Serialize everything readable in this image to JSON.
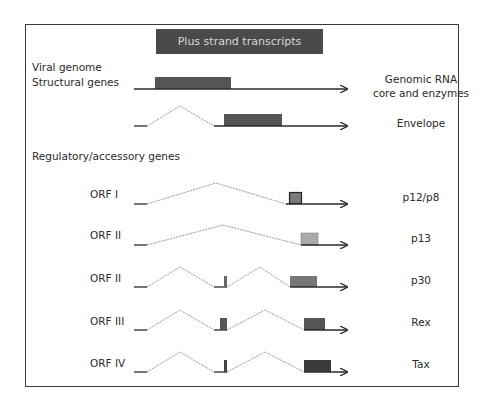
{
  "header": {
    "title": "Plus strand transcripts"
  },
  "sections": {
    "viral_genome": "Viral genome",
    "structural": "Structural genes",
    "regulatory": "Regulatory/accessory genes"
  },
  "rows": [
    {
      "left_label": "",
      "right_label": "Genomic RNA\ncore and enzymes",
      "right_line1": "Genomic RNA",
      "right_line2": "core and enzymes"
    },
    {
      "left_label": "",
      "right_label": "Envelope"
    },
    {
      "left_label": "ORF I",
      "right_label": "p12/p8"
    },
    {
      "left_label": "ORF II",
      "right_label": "p13"
    },
    {
      "left_label": "ORF II",
      "right_label": "p30"
    },
    {
      "left_label": "ORF III",
      "right_label": "Rex"
    },
    {
      "left_label": "ORF IV",
      "right_label": "Tax"
    }
  ],
  "colors": {
    "header_bg": "#4a4a4a",
    "structural_box": "#555555",
    "envelope_box": "#555555",
    "p12_box": "#7a7a7a",
    "p13_box": "#aaaaaa",
    "p30_box": "#777777",
    "rex_box": "#555555",
    "tax_box": "#3a3a3a",
    "line": "#2a2a2a",
    "intron": "#9a9a9a"
  }
}
